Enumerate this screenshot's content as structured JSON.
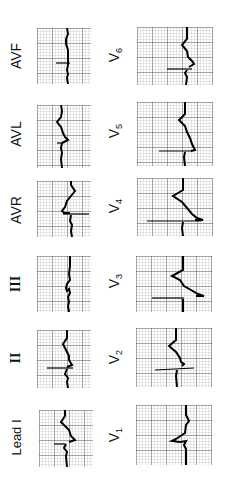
{
  "figure": {
    "colors": {
      "grid_minor": "#b5b5b5",
      "grid_major": "#555555",
      "trace": "#000000",
      "background": "#ffffff"
    }
  },
  "limb_leads": [
    {
      "id": "avf",
      "label": "AVF",
      "sub": ""
    },
    {
      "id": "avl",
      "label": "AVL",
      "sub": ""
    },
    {
      "id": "avr",
      "label": "AVR",
      "sub": ""
    },
    {
      "id": "iii",
      "label": "III",
      "sub": ""
    },
    {
      "id": "ii",
      "label": "II",
      "sub": ""
    },
    {
      "id": "i",
      "label": "Lead I",
      "sub": ""
    }
  ],
  "chest_leads": [
    {
      "id": "v6",
      "label": "V",
      "sub": "6"
    },
    {
      "id": "v5",
      "label": "V",
      "sub": "5"
    },
    {
      "id": "v4",
      "label": "V",
      "sub": "4"
    },
    {
      "id": "v3",
      "label": "V",
      "sub": "3"
    },
    {
      "id": "v2",
      "label": "V",
      "sub": "2"
    },
    {
      "id": "v1",
      "label": "V",
      "sub": "1"
    }
  ]
}
